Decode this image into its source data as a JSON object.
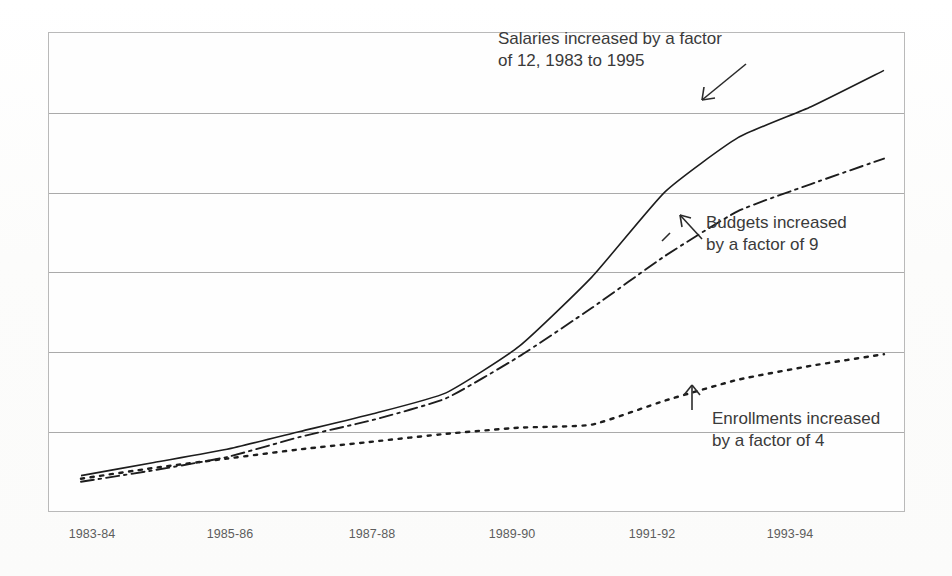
{
  "chart_data": {
    "type": "line",
    "title": "",
    "xlabel": "",
    "ylabel": "",
    "grid": true,
    "gridlines_y": 5,
    "legend_position": "none",
    "x": [
      "1983-84",
      "1984-85",
      "1985-86",
      "1986-87",
      "1987-88",
      "1988-89",
      "1989-90",
      "1990-91",
      "1991-92",
      "1992-93",
      "1993-94",
      "1994-95"
    ],
    "xticklabels": [
      "1983-84",
      "1985-86",
      "1987-88",
      "1989-90",
      "1991-92",
      "1993-94"
    ],
    "ylim": [
      0,
      6
    ],
    "ytick_labels": [],
    "series": [
      {
        "name": "Salaries",
        "style": "solid",
        "factor": 12,
        "values": [
          0.38,
          0.55,
          0.72,
          0.95,
          1.18,
          1.45,
          2.05,
          2.95,
          4.05,
          4.75,
          5.15,
          5.62
        ]
      },
      {
        "name": "Budgets",
        "style": "dash-dot",
        "factor": 9,
        "values": [
          0.3,
          0.45,
          0.62,
          0.88,
          1.1,
          1.38,
          1.92,
          2.55,
          3.22,
          3.8,
          4.15,
          4.48
        ]
      },
      {
        "name": "Enrollments",
        "style": "dotted",
        "factor": 4,
        "values": [
          0.34,
          0.48,
          0.6,
          0.72,
          0.82,
          0.92,
          1.0,
          1.04,
          1.35,
          1.62,
          1.8,
          1.95
        ]
      }
    ],
    "annotations": [
      {
        "id": "salaries",
        "text": "Salaries increased by a factor\nof 12, 1983 to 1995",
        "arrow": "down-right"
      },
      {
        "id": "budgets",
        "text": "Budgets increased\nby a factor of 9",
        "arrow": "up-left"
      },
      {
        "id": "enrollments",
        "text": "Enrollments increased\nby a factor of 4",
        "arrow": "up"
      }
    ]
  },
  "axis": {
    "ticks": [
      {
        "label": "1983-84",
        "x": 92
      },
      {
        "label": "1985-86",
        "x": 230
      },
      {
        "label": "1987-88",
        "x": 372
      },
      {
        "label": "1989-90",
        "x": 512
      },
      {
        "label": "1991-92",
        "x": 652
      },
      {
        "label": "1993-94",
        "x": 790
      }
    ]
  },
  "colors": {
    "frame": "#b9b9b9",
    "gridline": "#8d8d8d",
    "line": "#1d1d1d",
    "text": "#3a3a3a",
    "tick_text": "#5d5d5d",
    "background": "#fdfdfd"
  }
}
